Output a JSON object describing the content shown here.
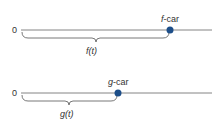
{
  "diagrams": [
    {
      "origin_label": "0",
      "car_label_var": "f",
      "car_label_suffix": "-car",
      "distance_label": "f(t)",
      "dot_color": "#1d4e89"
    },
    {
      "origin_label": "0",
      "car_label_var": "g",
      "car_label_suffix": "-car",
      "distance_label": "g(t)",
      "dot_color": "#1d4e89"
    }
  ]
}
